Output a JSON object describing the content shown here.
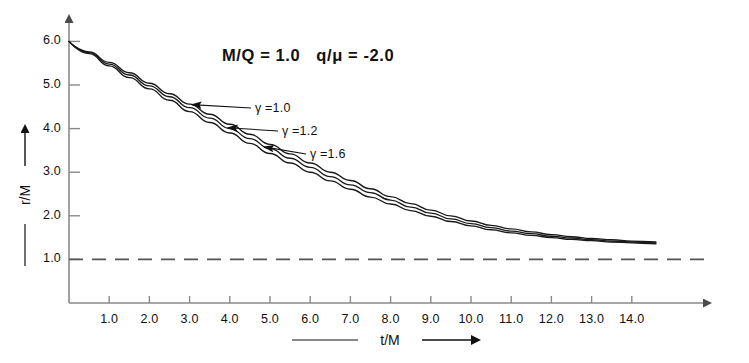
{
  "chart_data": {
    "type": "line",
    "title_parts": {
      "left": "M/Q = 1.0",
      "right": "q/μ = -2.0"
    },
    "xlabel": "t/M",
    "ylabel": "r/M",
    "xlabel_decorated": "——— t/M —→",
    "ylabel_decorated": "—— r/M —→",
    "xlim": [
      0,
      15.0
    ],
    "ylim": [
      0,
      6.6
    ],
    "xticks": [
      1.0,
      2.0,
      3.0,
      4.0,
      5.0,
      6.0,
      7.0,
      8.0,
      9.0,
      10.0,
      11.0,
      12.0,
      13.0,
      14.0
    ],
    "xticklabels": [
      "1.0",
      "2.0",
      "3.0",
      "4.0",
      "5.0",
      "6.0",
      "7.0",
      "8.0",
      "9.0",
      "10.0",
      "11.0",
      "12.0",
      "13.0",
      "14.0"
    ],
    "yticks": [
      1.0,
      2.0,
      3.0,
      4.0,
      5.0,
      6.0
    ],
    "yticklabels": [
      "1.0",
      "2.0",
      "3.0",
      "4.0",
      "5.0",
      "6.0"
    ],
    "grid": false,
    "legend_position": "inline-annotations",
    "reference_lines": [
      {
        "name": "horizon",
        "orientation": "horizontal",
        "value": 1.0,
        "style": "dashed",
        "color": "#555555"
      }
    ],
    "series": [
      {
        "name": "γ =1.0",
        "gamma": 1.0,
        "color": "#1a1a1a",
        "x": [
          0.0,
          0.5,
          1.0,
          1.5,
          2.0,
          2.5,
          3.0,
          3.5,
          4.0,
          4.5,
          5.0,
          5.5,
          6.0,
          6.5,
          7.0,
          7.5,
          8.0,
          8.5,
          9.0,
          9.5,
          10.0,
          10.5,
          11.0,
          11.5,
          12.0,
          12.5,
          13.0,
          13.5,
          14.0,
          14.6
        ],
        "y": [
          6.0,
          5.76,
          5.52,
          5.28,
          5.04,
          4.8,
          4.56,
          4.33,
          4.1,
          3.87,
          3.64,
          3.42,
          3.21,
          3.0,
          2.81,
          2.62,
          2.44,
          2.28,
          2.13,
          2.0,
          1.88,
          1.78,
          1.7,
          1.63,
          1.57,
          1.52,
          1.48,
          1.45,
          1.42,
          1.4
        ]
      },
      {
        "name": "γ =1.2",
        "gamma": 1.2,
        "color": "#1a1a1a",
        "x": [
          0.0,
          0.5,
          1.0,
          1.5,
          2.0,
          2.5,
          3.0,
          3.5,
          4.0,
          4.5,
          5.0,
          5.5,
          6.0,
          6.5,
          7.0,
          7.5,
          8.0,
          8.5,
          9.0,
          9.5,
          10.0,
          10.5,
          11.0,
          11.5,
          12.0,
          12.5,
          13.0,
          13.5,
          14.0,
          14.6
        ],
        "y": [
          6.0,
          5.74,
          5.48,
          5.23,
          4.98,
          4.73,
          4.48,
          4.24,
          4.0,
          3.77,
          3.54,
          3.32,
          3.11,
          2.9,
          2.71,
          2.53,
          2.36,
          2.2,
          2.06,
          1.93,
          1.82,
          1.73,
          1.65,
          1.59,
          1.53,
          1.49,
          1.45,
          1.42,
          1.4,
          1.38
        ]
      },
      {
        "name": "γ =1.6",
        "gamma": 1.6,
        "color": "#1a1a1a",
        "x": [
          0.0,
          0.5,
          1.0,
          1.5,
          2.0,
          2.5,
          3.0,
          3.5,
          4.0,
          4.5,
          5.0,
          5.5,
          6.0,
          6.5,
          7.0,
          7.5,
          8.0,
          8.5,
          9.0,
          9.5,
          10.0,
          10.5,
          11.0,
          11.5,
          12.0,
          12.5,
          13.0,
          13.5,
          14.0,
          14.6
        ],
        "y": [
          6.0,
          5.72,
          5.44,
          5.17,
          4.91,
          4.65,
          4.39,
          4.14,
          3.9,
          3.66,
          3.43,
          3.21,
          3.0,
          2.8,
          2.61,
          2.43,
          2.27,
          2.12,
          1.99,
          1.87,
          1.77,
          1.68,
          1.61,
          1.55,
          1.5,
          1.46,
          1.43,
          1.4,
          1.38,
          1.36
        ]
      }
    ],
    "annotations": [
      {
        "name": "gamma-1.0",
        "label": "γ =1.0",
        "at_x": 3.05,
        "at_y": 4.55,
        "label_x": 255,
        "label_y": 101
      },
      {
        "name": "gamma-1.2",
        "label": "γ =1.2",
        "at_x": 3.95,
        "at_y": 4.02,
        "label_x": 282,
        "label_y": 124
      },
      {
        "name": "gamma-1.6",
        "label": "γ =1.6",
        "at_x": 4.85,
        "at_y": 3.58,
        "label_x": 310,
        "label_y": 147
      }
    ]
  },
  "axes": {
    "x_arrow": true,
    "y_arrow": true,
    "tick_direction": "in",
    "axis_color": "#8a8a8a"
  }
}
